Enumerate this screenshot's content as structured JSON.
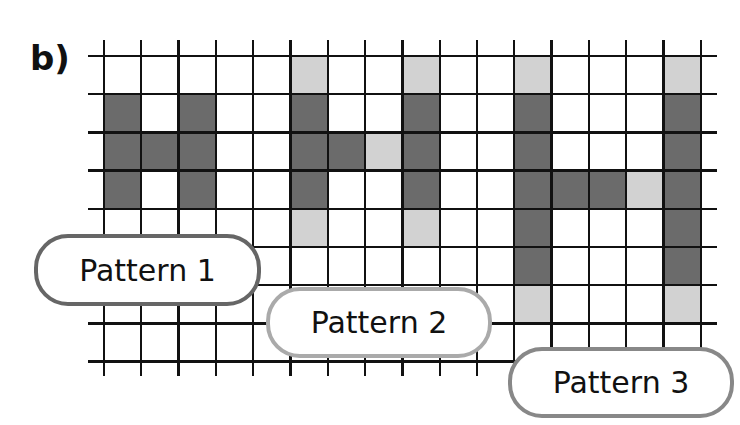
{
  "question_label": "b)",
  "colors": {
    "dark": "#6b6b6b",
    "light": "#d2d2d2",
    "line": "#111111"
  },
  "grid": {
    "cols": 16,
    "rows": 8,
    "x0": 104,
    "y0": 56,
    "cell_w": 37.3,
    "cell_h": 38.2,
    "line_left": 88,
    "line_right": 717,
    "line_top": 40,
    "line_bottom": 376
  },
  "patterns": [
    {
      "label": "Pattern 1",
      "border": "#666666",
      "box": {
        "left": 34,
        "top": 234,
        "width": 227,
        "height": 72
      },
      "dark": [
        [
          1,
          0
        ],
        [
          2,
          0
        ],
        [
          3,
          0
        ],
        [
          1,
          2
        ],
        [
          2,
          2
        ],
        [
          3,
          2
        ],
        [
          2,
          1
        ]
      ],
      "light": []
    },
    {
      "label": "Pattern 2",
      "border": "#aaaaaa",
      "box": {
        "left": 266,
        "top": 287,
        "width": 226,
        "height": 71
      },
      "dark": [
        [
          1,
          5
        ],
        [
          2,
          5
        ],
        [
          3,
          5
        ],
        [
          1,
          8
        ],
        [
          2,
          8
        ],
        [
          3,
          8
        ],
        [
          2,
          6
        ]
      ],
      "light": [
        [
          0,
          5
        ],
        [
          4,
          5
        ],
        [
          0,
          8
        ],
        [
          4,
          8
        ],
        [
          2,
          7
        ]
      ]
    },
    {
      "label": "Pattern 3",
      "border": "#888888",
      "box": {
        "left": 508,
        "top": 347,
        "width": 226,
        "height": 71
      },
      "dark": [
        [
          1,
          11
        ],
        [
          2,
          11
        ],
        [
          3,
          11
        ],
        [
          4,
          11
        ],
        [
          5,
          11
        ],
        [
          1,
          15
        ],
        [
          2,
          15
        ],
        [
          3,
          15
        ],
        [
          4,
          15
        ],
        [
          5,
          15
        ],
        [
          3,
          12
        ],
        [
          3,
          13
        ]
      ],
      "light": [
        [
          0,
          11
        ],
        [
          6,
          11
        ],
        [
          0,
          15
        ],
        [
          6,
          15
        ],
        [
          3,
          14
        ]
      ]
    }
  ]
}
